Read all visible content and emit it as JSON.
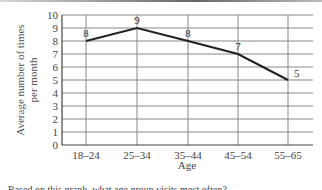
{
  "chart_data": {
    "type": "line",
    "title": "",
    "xlabel": "Age",
    "ylabel": "Average number of times per month",
    "ylabel_lines": [
      "Average number of times",
      "per month"
    ],
    "categories": [
      "18–24",
      "25–34",
      "35–44",
      "45–54",
      "55–65"
    ],
    "values": [
      8,
      9,
      8,
      7,
      5
    ],
    "data_labels": [
      "8",
      "9",
      "8",
      "7",
      "5"
    ],
    "yticks": [
      "0",
      "1",
      "2",
      "3",
      "4",
      "5",
      "6",
      "7",
      "8",
      "9",
      "10"
    ],
    "ylim": [
      0,
      10
    ],
    "grid": true,
    "legend": null,
    "line_color": "#222222",
    "grid_color": "#888888"
  },
  "caption": "Based on this graph, what age group visits most often?"
}
